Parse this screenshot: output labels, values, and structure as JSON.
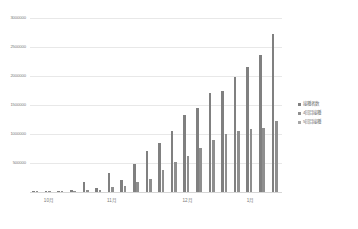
{
  "chart_data": {
    "type": "bar",
    "title": "",
    "subtitle": "",
    "xlabel": "",
    "ylabel": "",
    "grid": true,
    "legend_position": "right",
    "ylim": [
      0,
      3000000
    ],
    "ytick_labels": [
      "3000000",
      "2500000",
      "2000000",
      "1500000",
      "1000000",
      "500000",
      "0"
    ],
    "ytick_values": [
      3000000,
      2500000,
      2000000,
      1500000,
      1000000,
      500000,
      0
    ],
    "xtick_labels": [
      "10月",
      "11月",
      "12月",
      "1月"
    ],
    "xtick_positions": [
      1,
      6,
      12,
      17
    ],
    "categories": [
      "c1",
      "c2",
      "c3",
      "c4",
      "c5",
      "c6",
      "c7",
      "c8",
      "c9",
      "c10",
      "c11",
      "c12",
      "c13",
      "c14",
      "c15",
      "c16",
      "c17",
      "c18",
      "c19",
      "c20"
    ],
    "series": [
      {
        "name": "接種者数",
        "color": "#808080",
        "values": [
          15000,
          20000,
          25000,
          30000,
          170000,
          70000,
          330000,
          200000,
          480000,
          700000,
          840000,
          1060000,
          1320000,
          1440000,
          1700000,
          1740000,
          1980000,
          2160000,
          2360000,
          2720000
        ]
      },
      {
        "name": "4回目接種",
        "color": "#8f8f8f",
        "values": [
          8000,
          10000,
          14000,
          16000,
          40000,
          40000,
          80000,
          96000,
          180000,
          230000,
          380000,
          520000,
          620000,
          760000,
          900000,
          1000000,
          1060000,
          1090000,
          1100000,
          1230000
        ]
      },
      {
        "name": "5回目接種",
        "color": "#a6a6a6",
        "values": [
          0,
          0,
          0,
          0,
          0,
          0,
          0,
          0,
          0,
          0,
          0,
          0,
          0,
          0,
          0,
          0,
          0,
          0,
          0,
          0
        ]
      }
    ]
  }
}
